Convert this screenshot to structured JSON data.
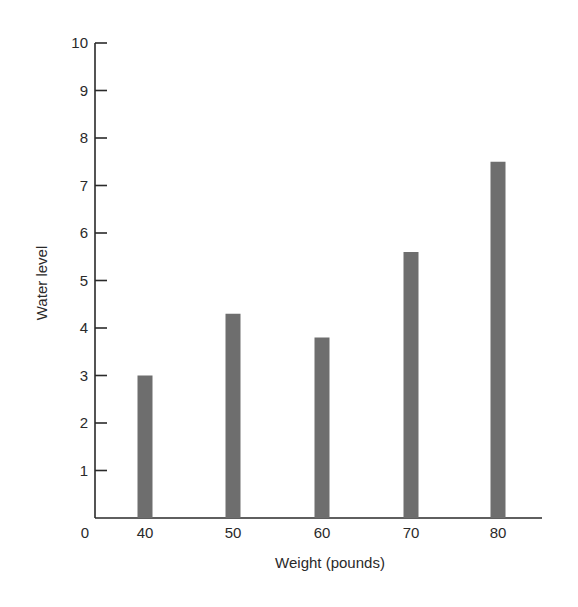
{
  "chart_data": {
    "type": "bar",
    "title": "",
    "xlabel": "Weight (pounds)",
    "ylabel": "Water level",
    "categories": [
      "40",
      "50",
      "60",
      "70",
      "80"
    ],
    "values": [
      3.0,
      4.3,
      3.8,
      5.6,
      7.5
    ],
    "x_origin_label": "0",
    "yticks": [
      1,
      2,
      3,
      4,
      5,
      6,
      7,
      8,
      9,
      10
    ],
    "ylim": [
      0,
      10
    ],
    "grid": false,
    "legend": null,
    "bar_color": "#6e6e6e",
    "axis_color": "#2a2a2a"
  },
  "layout": {
    "origin_x": 95,
    "origin_y": 518,
    "axis_right_x": 542,
    "y_top": 43,
    "bar_centers_x": [
      145,
      233,
      322,
      411,
      498
    ],
    "bar_width": 15,
    "tick_length": 12
  }
}
